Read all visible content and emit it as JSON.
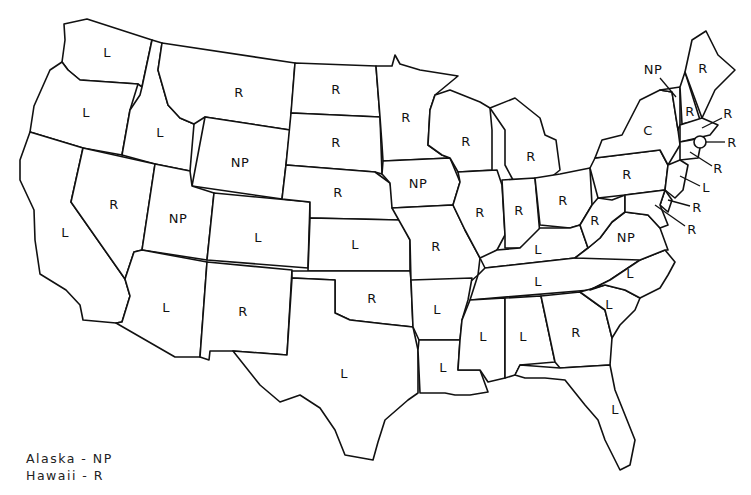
{
  "map": {
    "title": "",
    "states": [
      {
        "name": "Washington",
        "label": "L",
        "x": 107,
        "y": 53
      },
      {
        "name": "Oregon",
        "label": "L",
        "x": 86,
        "y": 113
      },
      {
        "name": "California",
        "label": "L",
        "x": 65,
        "y": 233
      },
      {
        "name": "Idaho",
        "label": "L",
        "x": 160,
        "y": 133
      },
      {
        "name": "Nevada",
        "label": "R",
        "x": 114,
        "y": 205
      },
      {
        "name": "Montana",
        "label": "R",
        "x": 239,
        "y": 93
      },
      {
        "name": "Wyoming",
        "label": "NP",
        "x": 240,
        "y": 163
      },
      {
        "name": "Utah",
        "label": "NP",
        "x": 178,
        "y": 219
      },
      {
        "name": "Colorado",
        "label": "L",
        "x": 258,
        "y": 238
      },
      {
        "name": "Arizona",
        "label": "L",
        "x": 166,
        "y": 308
      },
      {
        "name": "New Mexico",
        "label": "R",
        "x": 243,
        "y": 312
      },
      {
        "name": "North Dakota",
        "label": "R",
        "x": 336,
        "y": 90
      },
      {
        "name": "South Dakota",
        "label": "R",
        "x": 336,
        "y": 143
      },
      {
        "name": "Nebraska",
        "label": "R",
        "x": 338,
        "y": 193
      },
      {
        "name": "Kansas",
        "label": "L",
        "x": 355,
        "y": 245
      },
      {
        "name": "Oklahoma",
        "label": "R",
        "x": 372,
        "y": 299
      },
      {
        "name": "Texas",
        "label": "L",
        "x": 344,
        "y": 374
      },
      {
        "name": "Minnesota",
        "label": "R",
        "x": 406,
        "y": 118
      },
      {
        "name": "Iowa",
        "label": "NP",
        "x": 418,
        "y": 184
      },
      {
        "name": "Missouri",
        "label": "R",
        "x": 436,
        "y": 247
      },
      {
        "name": "Arkansas",
        "label": "L",
        "x": 437,
        "y": 310
      },
      {
        "name": "Louisiana",
        "label": "L",
        "x": 443,
        "y": 368
      },
      {
        "name": "Wisconsin",
        "label": "R",
        "x": 466,
        "y": 142
      },
      {
        "name": "Illinois",
        "label": "R",
        "x": 480,
        "y": 213
      },
      {
        "name": "Michigan",
        "label": "R",
        "x": 531,
        "y": 157
      },
      {
        "name": "Indiana",
        "label": "R",
        "x": 519,
        "y": 211
      },
      {
        "name": "Ohio",
        "label": "R",
        "x": 563,
        "y": 201
      },
      {
        "name": "Kentucky",
        "label": "L",
        "x": 538,
        "y": 250
      },
      {
        "name": "Tennessee",
        "label": "L",
        "x": 538,
        "y": 282
      },
      {
        "name": "Mississippi",
        "label": "L",
        "x": 483,
        "y": 337
      },
      {
        "name": "Alabama",
        "label": "L",
        "x": 523,
        "y": 337
      },
      {
        "name": "Georgia",
        "label": "R",
        "x": 576,
        "y": 333
      },
      {
        "name": "Florida",
        "label": "L",
        "x": 615,
        "y": 410
      },
      {
        "name": "South Carolina",
        "label": "L",
        "x": 609,
        "y": 305
      },
      {
        "name": "North Carolina",
        "label": "L",
        "x": 630,
        "y": 274
      },
      {
        "name": "Virginia",
        "label": "NP",
        "x": 626,
        "y": 238
      },
      {
        "name": "West Virginia",
        "label": "R",
        "x": 595,
        "y": 221
      },
      {
        "name": "Pennsylvania",
        "label": "R",
        "x": 627,
        "y": 175
      },
      {
        "name": "New York",
        "label": "C",
        "x": 648,
        "y": 131
      },
      {
        "name": "Vermont",
        "label": "NP",
        "x": 653,
        "y": 70
      },
      {
        "name": "New Hampshire",
        "label": "R",
        "x": 690,
        "y": 112
      },
      {
        "name": "Maine",
        "label": "R",
        "x": 703,
        "y": 69
      },
      {
        "name": "Massachusetts",
        "label": "R",
        "x": 728,
        "y": 114
      },
      {
        "name": "Rhode Island",
        "label": "R",
        "x": 732,
        "y": 143
      },
      {
        "name": "Connecticut",
        "label": "R",
        "x": 718,
        "y": 169
      },
      {
        "name": "New Jersey",
        "label": "L",
        "x": 706,
        "y": 188
      },
      {
        "name": "Delaware",
        "label": "R",
        "x": 697,
        "y": 208
      },
      {
        "name": "Maryland",
        "label": "R",
        "x": 692,
        "y": 230
      }
    ]
  },
  "legend": {
    "alaska": "Alaska - NP",
    "hawaii": "Hawaii -  R"
  }
}
